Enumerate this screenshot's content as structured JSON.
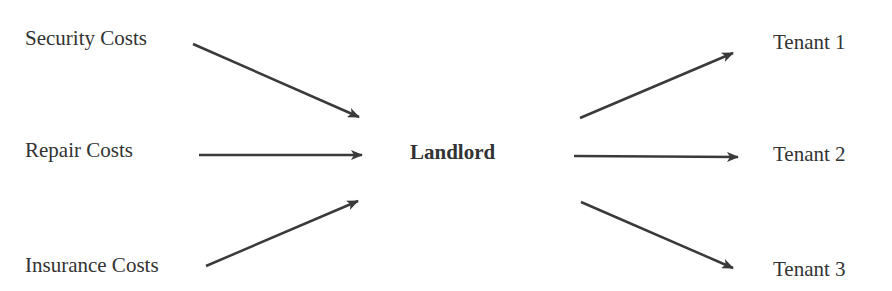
{
  "diagram": {
    "sources": [
      {
        "label": "Security Costs"
      },
      {
        "label": "Repair Costs"
      },
      {
        "label": "Insurance Costs"
      }
    ],
    "center": {
      "label": "Landlord"
    },
    "targets": [
      {
        "label": "Tenant 1"
      },
      {
        "label": "Tenant 2"
      },
      {
        "label": "Tenant 3"
      }
    ],
    "colors": {
      "arrow": "#3a3a3a",
      "text": "#333333"
    }
  }
}
